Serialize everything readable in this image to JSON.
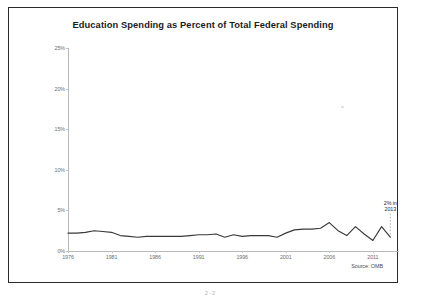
{
  "figure": {
    "title": "Education Spending as Percent of Total Federal Spending",
    "source_note": "Source: OMB",
    "footer_mark": "2-2",
    "frame_color": "#2b2b2b",
    "line_color": "#3a3a3a",
    "axis_color": "#b9b9b9",
    "label_color": "#6d6d6d"
  },
  "annotation": {
    "text": "2% in\n2013",
    "line1": "2% in",
    "line2": "2013",
    "at_year": 2013,
    "at_value": 2
  },
  "chart_data": {
    "type": "line",
    "title": "Education Spending as Percent of Total Federal Spending",
    "xlabel": "",
    "ylabel": "",
    "xlim": [
      1976,
      2014
    ],
    "ylim": [
      0,
      25
    ],
    "ytick_values": [
      0,
      5,
      10,
      15,
      20,
      25
    ],
    "ytick_labels": [
      "0%",
      "5%",
      "10%",
      "15%",
      "20%",
      "25%"
    ],
    "xtick_values": [
      1976,
      1981,
      1986,
      1991,
      1996,
      2001,
      2006,
      2011
    ],
    "xtick_labels": [
      "1976",
      "1981",
      "1986",
      "1991",
      "1996",
      "2001",
      "2006",
      "2011"
    ],
    "grid": false,
    "legend": false,
    "series": [
      {
        "name": "Education spending share of federal spending",
        "x": [
          1976,
          1977,
          1978,
          1979,
          1980,
          1981,
          1982,
          1983,
          1984,
          1985,
          1986,
          1987,
          1988,
          1989,
          1990,
          1991,
          1992,
          1993,
          1994,
          1995,
          1996,
          1997,
          1998,
          1999,
          2000,
          2001,
          2002,
          2003,
          2004,
          2005,
          2006,
          2007,
          2008,
          2009,
          2010,
          2011,
          2012,
          2013
        ],
        "values": [
          2.2,
          2.2,
          2.3,
          2.5,
          2.4,
          2.3,
          1.9,
          1.8,
          1.7,
          1.8,
          1.8,
          1.8,
          1.8,
          1.8,
          1.9,
          2.0,
          2.0,
          2.1,
          1.7,
          2.0,
          1.8,
          1.9,
          1.9,
          1.9,
          1.7,
          2.2,
          2.6,
          2.7,
          2.7,
          2.8,
          3.5,
          2.5,
          1.9,
          3.0,
          2.1,
          1.3,
          3.0,
          1.7
        ]
      }
    ],
    "annotations": [
      {
        "label": "2% in 2013",
        "x": 2013,
        "y": 2
      }
    ],
    "source": "Source: OMB"
  }
}
